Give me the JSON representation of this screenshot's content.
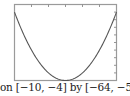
{
  "chart_data": {
    "type": "line",
    "title": "",
    "caption": "on [−10, −4] by [−64, −54]",
    "xlabel": "",
    "ylabel": "",
    "xlim": [
      -10,
      -4
    ],
    "ylim": [
      -64,
      -54
    ],
    "x_tick_step": 1,
    "y_tick_step": 1,
    "grid": false,
    "legend": null,
    "function": "y = (x + 7)^2 - 64",
    "series": [
      {
        "name": "parabola",
        "x": [
          -10,
          -9.5,
          -9,
          -8.5,
          -8,
          -7.5,
          -7,
          -6.5,
          -6,
          -5.5,
          -5,
          -4.5,
          -4
        ],
        "values": [
          -55,
          -57.75,
          -60,
          -61.75,
          -63,
          -63.75,
          -64,
          -63.75,
          -63,
          -61.75,
          -60,
          -57.75,
          -55
        ]
      }
    ]
  },
  "colors": {
    "frame": "#9a9a9a",
    "curve": "#555555",
    "ticks": "#8a8a8a",
    "caption": "#222222"
  }
}
